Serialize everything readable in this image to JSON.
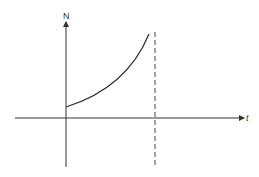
{
  "diagram": {
    "y_axis_label": "N",
    "x_axis_label": "t",
    "colors": {
      "line": "#333333",
      "background": "#ffffff"
    }
  }
}
